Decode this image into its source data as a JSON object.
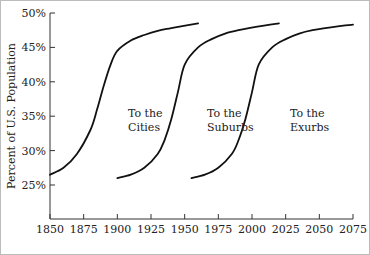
{
  "chart_data": {
    "type": "line",
    "title": "",
    "xlabel": "",
    "ylabel": "Percent of U.S. Population",
    "xlim": [
      1850,
      2075
    ],
    "ylim": [
      20,
      50
    ],
    "x_ticks": [
      "1850",
      "1875",
      "1900",
      "1925",
      "1950",
      "1975",
      "2000",
      "2025",
      "2050",
      "2075"
    ],
    "y_ticks": [
      "25%",
      "30%",
      "35%",
      "40%",
      "45%",
      "50%"
    ],
    "grid": false,
    "legend": "none",
    "series": [
      {
        "name": "To the Cities",
        "label_lines": [
          "To the",
          "Cities"
        ],
        "x": [
          1850,
          1860,
          1870,
          1880,
          1885,
          1890,
          1895,
          1900,
          1910,
          1920,
          1930,
          1940,
          1960
        ],
        "y": [
          26.5,
          27.5,
          29.5,
          33,
          36,
          39.5,
          42.5,
          44.5,
          46,
          46.8,
          47.4,
          47.8,
          48.5
        ]
      },
      {
        "name": "To the Suburbs",
        "label_lines": [
          "To the",
          "Suburbs"
        ],
        "x": [
          1900,
          1910,
          1920,
          1930,
          1935,
          1940,
          1945,
          1950,
          1960,
          1970,
          1980,
          1990,
          2010,
          2020
        ],
        "y": [
          26,
          26.5,
          27.5,
          29.5,
          31.5,
          34.5,
          38.5,
          42.5,
          45,
          46.2,
          47,
          47.5,
          48.2,
          48.5
        ]
      },
      {
        "name": "To the Exurbs",
        "label_lines": [
          "To the",
          "Exurbs"
        ],
        "x": [
          1955,
          1965,
          1975,
          1985,
          1990,
          1995,
          2000,
          2005,
          2015,
          2025,
          2035,
          2045,
          2065,
          2075
        ],
        "y": [
          26,
          26.5,
          27.5,
          29.5,
          31.5,
          34.5,
          38.5,
          42.5,
          45,
          46.2,
          47,
          47.5,
          48.1,
          48.3
        ]
      }
    ]
  }
}
